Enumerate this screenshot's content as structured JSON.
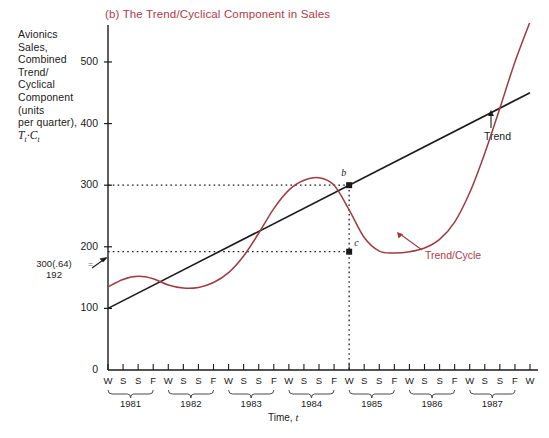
{
  "chart_data": {
    "type": "line",
    "title": "(b) The Trend/Cyclical Component in Sales",
    "ylabel": "Avionics Sales, Combined Trend/Cyclical Component (units per quarter), Tt·Ct",
    "xlabel": "Time, t",
    "ylim": [
      0,
      560
    ],
    "yticks": [
      0,
      100,
      200,
      300,
      400,
      500
    ],
    "ytick_labels": [
      "0",
      "100",
      "200",
      "300",
      "400",
      "500"
    ],
    "grid": false,
    "legend_position": "inline-annotations",
    "years": [
      "1981",
      "1982",
      "1983",
      "1984",
      "1985",
      "1986",
      "1987"
    ],
    "quarter_labels": [
      "W",
      "S",
      "S",
      "F"
    ],
    "xtick_labels": [
      "W",
      "S",
      "S",
      "F",
      "W",
      "S",
      "S",
      "F",
      "W",
      "S",
      "S",
      "F",
      "W",
      "S",
      "S",
      "F",
      "W",
      "S",
      "S",
      "F",
      "W",
      "S",
      "S",
      "F",
      "W",
      "S",
      "S",
      "F",
      "W"
    ],
    "series": [
      {
        "name": "Trend",
        "color": "#1b1b1b",
        "type": "line",
        "description": "straight rising trend line",
        "x": [
          0,
          28
        ],
        "values": [
          100,
          450
        ]
      },
      {
        "name": "Trend/Cycle",
        "color": "#9e3b43",
        "type": "curve",
        "description": "trend multiplied by cyclical component, wavy curve rising off chart",
        "x": [
          0,
          1,
          2,
          3,
          4,
          5,
          6,
          7,
          8,
          9,
          10,
          11,
          12,
          13,
          14,
          15,
          16,
          17,
          18,
          19,
          20,
          21,
          22,
          23,
          24,
          25,
          26,
          27,
          28
        ],
        "values": [
          135,
          147,
          152,
          148,
          138,
          133,
          134,
          142,
          158,
          185,
          222,
          262,
          292,
          308,
          312,
          300,
          260,
          215,
          193,
          190,
          192,
          198,
          212,
          240,
          288,
          352,
          425,
          500,
          565
        ]
      }
    ],
    "annotations": [
      {
        "name": "point-b",
        "label": "b",
        "x": 16,
        "y": 300,
        "note": "trend value at Winter 1985"
      },
      {
        "name": "point-c",
        "label": "c",
        "x": 16,
        "y": 192,
        "note": "trend/cycle value at Winter 1985"
      },
      {
        "name": "calc",
        "line1": "300(.64)",
        "line2": "192",
        "equals": "="
      },
      {
        "name": "trend-label",
        "label": "Trend"
      },
      {
        "name": "trend-cycle-label",
        "label": "Trend/Cycle"
      }
    ]
  },
  "axis_caption": {
    "line1": "Avionics",
    "line2": "Sales,",
    "line3": "Combined",
    "line4": "Trend/",
    "line5": "Cyclical",
    "line6": "Component",
    "line7": "(units",
    "line8": "per quarter),",
    "symbol_T": "T",
    "symbol_sub_t1": "t",
    "symbol_dot": "·",
    "symbol_C": "C",
    "symbol_sub_t2": "t"
  },
  "xaxis": {
    "title_text": "Time, ",
    "title_symbol": "t"
  },
  "colors": {
    "accent_red": "#b03a48",
    "curve": "#9e3b43",
    "ink": "#1b1b1b"
  }
}
